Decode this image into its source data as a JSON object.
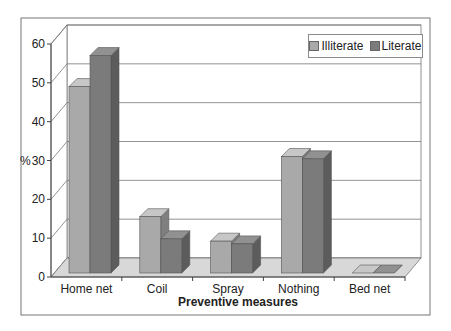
{
  "chart_data": {
    "type": "bar",
    "title": "",
    "xlabel": "Preventive measures",
    "ylabel": "%",
    "ylim": [
      0,
      60
    ],
    "yticks": [
      0,
      10,
      20,
      30,
      40,
      50,
      60
    ],
    "grid": true,
    "legend_position": "top-right",
    "categories": [
      "Home net",
      "Coil",
      "Spray",
      "Nothing",
      "Bed net"
    ],
    "series": [
      {
        "name": "Illiterate",
        "color": "#a9a9a9",
        "values": [
          48,
          14.5,
          8.2,
          30,
          0
        ]
      },
      {
        "name": "Literate",
        "color": "#7b7b7b",
        "values": [
          56,
          8.8,
          7.5,
          29.4,
          0
        ]
      }
    ]
  },
  "legend": {
    "items": [
      "Illiterate",
      "Literate"
    ]
  }
}
